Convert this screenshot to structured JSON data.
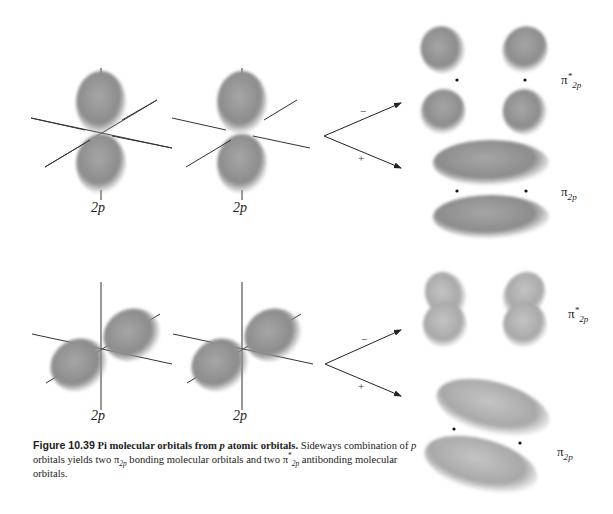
{
  "figure": {
    "number": "Figure 10.39",
    "title": "Pi molecular orbitals from",
    "title_var": "p",
    "title_end": "atomic orbitals.",
    "caption_parts": {
      "p1_var": "p",
      "p1": " orbitals yields two ",
      "pi": "π",
      "sub_2p": "2p",
      "p2": " bonding molecular orbitals and two ",
      "star": "*",
      "p3": " antibonding molecular orbitals.",
      "lead": "Sideways combination of"
    }
  },
  "top_row": {
    "atomic_labels": [
      "2p",
      "2p"
    ],
    "combination_signs": {
      "minus": "−",
      "plus": "+"
    },
    "mo_labels": {
      "antibonding": {
        "symbol": "π",
        "sub": "2p",
        "sup": "*"
      },
      "bonding": {
        "symbol": "π",
        "sub": "2p"
      }
    }
  },
  "bottom_row": {
    "atomic_labels": [
      "2p",
      "2p"
    ],
    "combination_signs": {
      "minus": "−",
      "plus": "+"
    },
    "mo_labels": {
      "antibonding": {
        "symbol": "π",
        "sub": "2p",
        "sup": "*"
      },
      "bonding": {
        "symbol": "π",
        "sub": "2p"
      }
    }
  },
  "colors": {
    "lobe_fill": "#8a8a8a",
    "lobe_light": "#b5b5b5",
    "axis": "#333333",
    "background": "#ffffff"
  }
}
